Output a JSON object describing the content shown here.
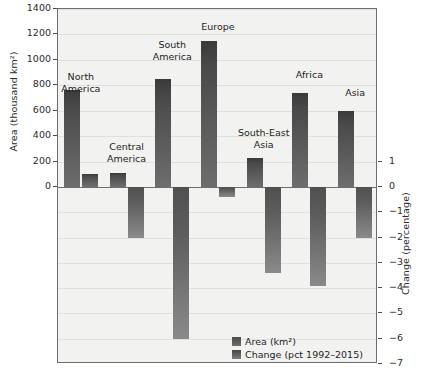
{
  "chart_data": {
    "type": "bar",
    "title": "",
    "subtitle": "",
    "categories": [
      "North America",
      "Central America",
      "South America",
      "Europe",
      "South-East Asia",
      "Africa",
      "Asia"
    ],
    "series": [
      {
        "name": "Area (km²)",
        "axis": "left",
        "values": [
          763,
          110,
          850,
          1150,
          230,
          740,
          600
        ]
      },
      {
        "name": "Change (pct 1992–2015)",
        "axis": "right",
        "values": [
          0.5,
          -2.0,
          -6.0,
          -0.4,
          -3.4,
          -3.9,
          -2.0
        ]
      }
    ],
    "ylabel": "Area (thousand km²)",
    "y2label": "Change (percentage)",
    "xlabel": "",
    "ylim": [
      0,
      1400
    ],
    "y2lim": [
      -7,
      1
    ],
    "yticks": [
      0,
      200,
      400,
      600,
      800,
      1000,
      1200,
      1400
    ],
    "y2ticks": [
      1,
      0,
      -1,
      -2,
      -3,
      -4,
      -5,
      -6,
      -7
    ],
    "grid": true,
    "legend_position": "lower-right",
    "legend_entries": [
      "Area (km²)",
      "Change (pct 1992–2015)"
    ],
    "colors": {
      "background": "#f2f2f0",
      "frame": "#6e6e6e",
      "gridline": "#e0e0dc",
      "bar_area": "#4a4a4a",
      "bar_change": "#6d6d6d",
      "text": "#1e1e1e"
    }
  },
  "axes": {
    "left": {
      "title": "Area (thousand km²)",
      "ticks": [
        "1400",
        "1200",
        "1000",
        "800",
        "600",
        "400",
        "200",
        "0"
      ]
    },
    "right": {
      "title": "Change (percentage)",
      "ticks": [
        "1",
        "0",
        "−1",
        "−2",
        "−3",
        "−4",
        "−5",
        "−6",
        "−7"
      ]
    }
  },
  "group_labels": [
    "North\nAmerica",
    "Central\nAmerica",
    "South\nAmerica",
    "Europe",
    "South-East\nAsia",
    "Africa",
    "Asia"
  ],
  "legend": {
    "items": [
      {
        "label": "Area (km²)"
      },
      {
        "label": "Change (pct 1992–2015)"
      }
    ]
  }
}
